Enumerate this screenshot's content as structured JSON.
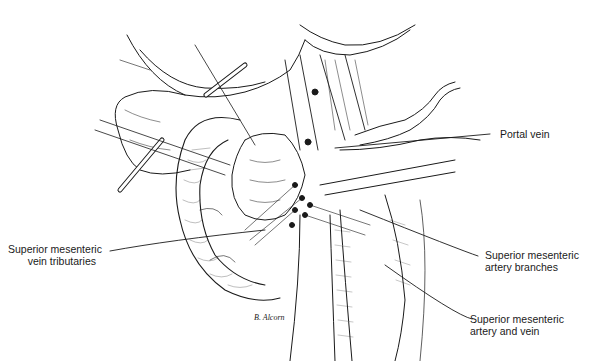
{
  "figure": {
    "type": "surgical-anatomy-illustration",
    "background": "#ffffff",
    "ink_color": "#1a1a1a",
    "artist_signature": "B. Alcorn",
    "labels": [
      {
        "id": "portal-vein",
        "lines": [
          "Portal vein"
        ]
      },
      {
        "id": "smv-tributaries",
        "lines": [
          "Superior mesenteric",
          "vein tributaries"
        ]
      },
      {
        "id": "sma-branches",
        "lines": [
          "Superior mesenteric",
          "artery branches"
        ]
      },
      {
        "id": "sma-smv",
        "lines": [
          "Superior mesenteric",
          "artery and vein"
        ]
      }
    ]
  }
}
